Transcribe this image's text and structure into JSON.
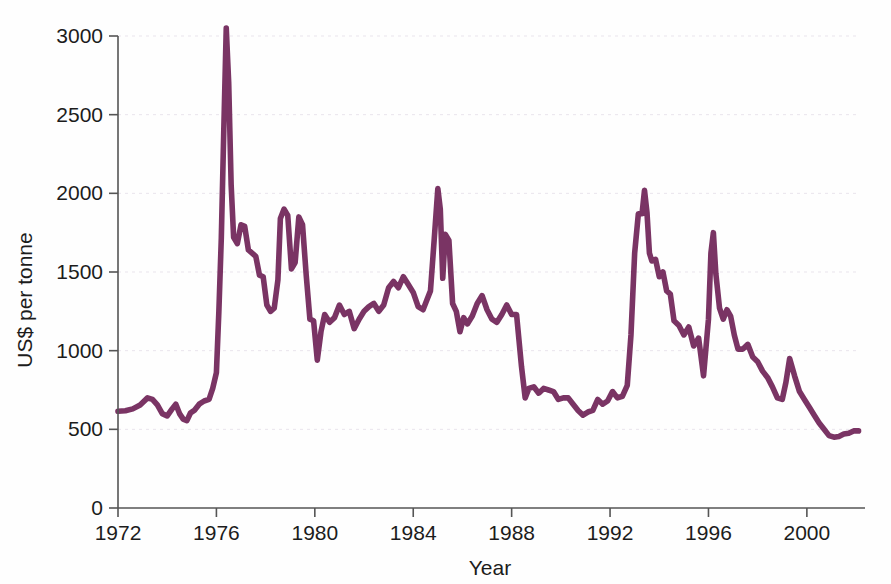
{
  "chart_data": {
    "type": "line",
    "title": "",
    "subtitle": "",
    "xlabel": "Year",
    "ylabel": "US$ per tonne",
    "xlim": [
      1972,
      2002.2
    ],
    "ylim": [
      0,
      3000
    ],
    "xticks": [
      1972,
      1976,
      1980,
      1984,
      1988,
      1992,
      1996,
      2000
    ],
    "xtick_labels": [
      "1972",
      "1976",
      "1980",
      "1984",
      "1988",
      "1992",
      "1996",
      "2000"
    ],
    "yticks": [
      0,
      500,
      1000,
      1500,
      2000,
      2500,
      3000
    ],
    "ytick_labels": [
      "0",
      "500",
      "1000",
      "1500",
      "2000",
      "2500",
      "3000"
    ],
    "grid": true,
    "grid_axis": "y",
    "legend": false,
    "legend_position": "none",
    "line_color": "#7a3464",
    "line_width": 5.6,
    "annotations": [],
    "series": [
      {
        "name": "US$ per tonne",
        "color": "#7a3464",
        "x": [
          1972.0,
          1972.3,
          1972.6,
          1972.9,
          1973.2,
          1973.4,
          1973.6,
          1973.8,
          1974.0,
          1974.2,
          1974.35,
          1974.5,
          1974.65,
          1974.8,
          1974.95,
          1975.1,
          1975.3,
          1975.5,
          1975.7,
          1975.85,
          1976.0,
          1976.1,
          1976.2,
          1976.3,
          1976.4,
          1976.5,
          1976.6,
          1976.7,
          1976.85,
          1977.0,
          1977.15,
          1977.3,
          1977.45,
          1977.6,
          1977.75,
          1977.9,
          1978.05,
          1978.2,
          1978.35,
          1978.5,
          1978.6,
          1978.75,
          1978.9,
          1979.05,
          1979.2,
          1979.35,
          1979.5,
          1979.65,
          1979.8,
          1979.95,
          1980.1,
          1980.25,
          1980.4,
          1980.6,
          1980.8,
          1981.0,
          1981.2,
          1981.4,
          1981.6,
          1981.8,
          1982.0,
          1982.2,
          1982.4,
          1982.6,
          1982.8,
          1983.0,
          1983.2,
          1983.4,
          1983.6,
          1983.8,
          1984.0,
          1984.2,
          1984.4,
          1984.55,
          1984.7,
          1984.85,
          1985.0,
          1985.1,
          1985.2,
          1985.3,
          1985.45,
          1985.6,
          1985.75,
          1985.9,
          1986.05,
          1986.2,
          1986.4,
          1986.6,
          1986.8,
          1987.0,
          1987.2,
          1987.4,
          1987.6,
          1987.8,
          1988.0,
          1988.2,
          1988.4,
          1988.55,
          1988.7,
          1988.9,
          1989.1,
          1989.3,
          1989.5,
          1989.7,
          1989.9,
          1990.1,
          1990.3,
          1990.5,
          1990.7,
          1990.9,
          1991.1,
          1991.3,
          1991.5,
          1991.7,
          1991.9,
          1992.1,
          1992.3,
          1992.5,
          1992.7,
          1992.85,
          1993.0,
          1993.15,
          1993.3,
          1993.4,
          1993.5,
          1993.6,
          1993.7,
          1993.85,
          1994.0,
          1994.15,
          1994.3,
          1994.45,
          1994.6,
          1994.8,
          1995.0,
          1995.2,
          1995.4,
          1995.6,
          1995.8,
          1996.0,
          1996.1,
          1996.2,
          1996.3,
          1996.45,
          1996.6,
          1996.75,
          1996.9,
          1997.05,
          1997.2,
          1997.4,
          1997.6,
          1997.8,
          1998.0,
          1998.2,
          1998.4,
          1998.6,
          1998.8,
          1999.0,
          1999.15,
          1999.3,
          1999.5,
          1999.7,
          1999.9,
          2000.1,
          2000.3,
          2000.5,
          2000.7,
          2000.9,
          2001.1,
          2001.3,
          2001.5,
          2001.7,
          2001.9,
          2002.1
        ],
        "y": [
          615,
          618,
          630,
          655,
          700,
          690,
          655,
          600,
          585,
          630,
          660,
          600,
          565,
          555,
          605,
          620,
          660,
          680,
          690,
          760,
          860,
          1250,
          1720,
          2400,
          3050,
          2700,
          2050,
          1720,
          1680,
          1800,
          1790,
          1640,
          1620,
          1600,
          1480,
          1470,
          1290,
          1250,
          1270,
          1450,
          1840,
          1900,
          1860,
          1520,
          1560,
          1850,
          1800,
          1480,
          1200,
          1190,
          940,
          1120,
          1230,
          1180,
          1210,
          1290,
          1230,
          1250,
          1140,
          1200,
          1250,
          1280,
          1300,
          1250,
          1290,
          1400,
          1440,
          1400,
          1470,
          1420,
          1370,
          1280,
          1260,
          1320,
          1380,
          1700,
          2030,
          1900,
          1460,
          1740,
          1700,
          1300,
          1250,
          1120,
          1210,
          1170,
          1220,
          1300,
          1350,
          1260,
          1200,
          1180,
          1230,
          1290,
          1230,
          1230,
          900,
          700,
          760,
          770,
          730,
          760,
          750,
          740,
          690,
          700,
          700,
          660,
          620,
          590,
          610,
          620,
          690,
          660,
          680,
          740,
          700,
          710,
          780,
          1100,
          1620,
          1870,
          1870,
          2020,
          1880,
          1620,
          1570,
          1580,
          1470,
          1500,
          1380,
          1360,
          1190,
          1160,
          1100,
          1150,
          1030,
          1080,
          840,
          1200,
          1620,
          1750,
          1490,
          1270,
          1200,
          1260,
          1220,
          1100,
          1010,
          1010,
          1040,
          960,
          930,
          870,
          830,
          770,
          700,
          690,
          800,
          950,
          840,
          740,
          690,
          640,
          590,
          540,
          500,
          460,
          450,
          455,
          470,
          475,
          490,
          490
        ]
      }
    ]
  },
  "axes": {
    "x_axis_name": "year-axis",
    "y_axis_name": "price-axis"
  }
}
